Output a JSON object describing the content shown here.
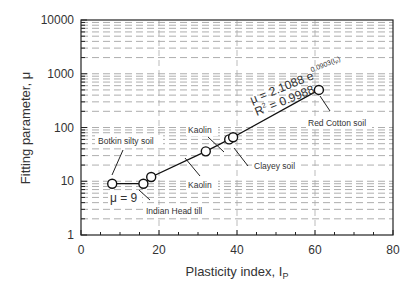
{
  "chart_data": {
    "type": "scatter",
    "title": "",
    "xlabel": "Plasticity index, I",
    "xlabel_sub": "P",
    "ylabel": "Fitting parameter, μ",
    "xlim": [
      0,
      80
    ],
    "ylim": [
      1,
      10000
    ],
    "yscale": "log",
    "grid": true,
    "x_ticks": [
      "0",
      "20",
      "40",
      "60",
      "80"
    ],
    "y_ticks": [
      "1",
      "10",
      "100",
      "1000",
      "10000"
    ],
    "series": [
      {
        "name": "data",
        "points": [
          {
            "x": 8,
            "y": 9
          },
          {
            "x": 16,
            "y": 9
          },
          {
            "x": 18,
            "y": 12
          },
          {
            "x": 32,
            "y": 36
          },
          {
            "x": 38,
            "y": 60
          },
          {
            "x": 39,
            "y": 66
          },
          {
            "x": 61,
            "y": 500
          }
        ]
      }
    ],
    "fit_line": {
      "equation": "μ = 2.1088 e",
      "exponent": "0.0903(I",
      "exponent_sub": "P",
      "exponent_close": ")",
      "r2": "R",
      "r2_value": " = 0.9988"
    },
    "annotations": [
      {
        "text": "Botkin silty soil",
        "x": 8,
        "y": 9
      },
      {
        "text": "μ = 9",
        "x": 10,
        "y": 6
      },
      {
        "text": "Indian Head till",
        "x": 16,
        "y": 9
      },
      {
        "text": "Kaolin",
        "x": 32,
        "y": 36
      },
      {
        "text": "Kaolin",
        "x": 38,
        "y": 60
      },
      {
        "text": "Clayey soil",
        "x": 39,
        "y": 66
      },
      {
        "text": "Red Cotton soil",
        "x": 61,
        "y": 500
      }
    ]
  }
}
